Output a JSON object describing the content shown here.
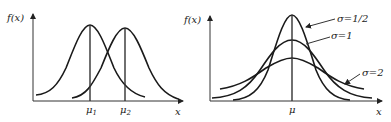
{
  "left_panel": {
    "y_axis_label": "f(x)",
    "x_axis_label": "x",
    "mean_labels": [
      {
        "symbol": "μ",
        "subscript": "1"
      },
      {
        "symbol": "μ",
        "subscript": "2"
      }
    ],
    "description": "Two normal curves with equal σ and different means μ1 < μ2"
  },
  "right_panel": {
    "y_axis_label": "f(x)",
    "x_axis_label": "x",
    "mean_label": "μ",
    "curve_labels": [
      "σ=1/2",
      "σ=1",
      "σ=2"
    ],
    "description": "Three normal curves with same mean μ and different σ"
  },
  "colors": {
    "stroke": "#1a1a1a",
    "background": "#ffffff"
  }
}
